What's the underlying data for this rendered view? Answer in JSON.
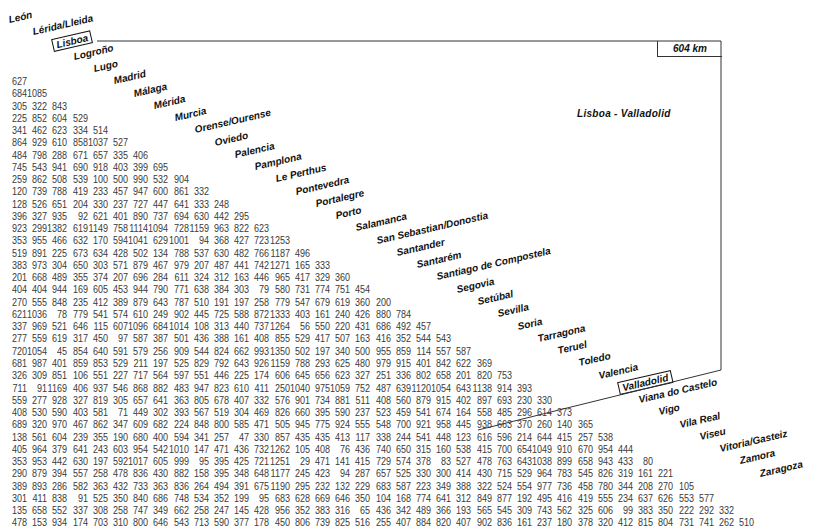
{
  "highlight": {
    "distance_label": "604 km",
    "route_label": "Lisboa - Valladolid",
    "from": "Lisboa",
    "to": "Valladolid"
  },
  "cities": [
    "León",
    "Lérida/Lleida",
    "Lisboa",
    "Logroño",
    "Lugo",
    "Madrid",
    "Málaga",
    "Mérida",
    "Murcia",
    "Orense/Ourense",
    "Oviedo",
    "Palencia",
    "Pamplona",
    "Le Perthus",
    "Pontevedra",
    "Portalegre",
    "Porto",
    "Salamanca",
    "San Sebastian/Donostia",
    "Santander",
    "Santarém",
    "Santiago de Compostela",
    "Segovia",
    "Setúbal",
    "Sevilla",
    "Soria",
    "Tarragona",
    "Teruel",
    "Toledo",
    "Valencia",
    "Valladolid",
    "Viana do Castelo",
    "Vigo",
    "Vila Real",
    "Viseu",
    "Vitoria/Gasteiz",
    "Zamora",
    "Zaragoza"
  ],
  "rows": [
    [
      "627"
    ],
    [
      "684",
      "1085"
    ],
    [
      "305",
      "322",
      "843"
    ],
    [
      "225",
      "852",
      "604",
      "529"
    ],
    [
      "341",
      "462",
      "623",
      "334",
      "514"
    ],
    [
      "864",
      "929",
      "610",
      "858",
      "1037",
      "527"
    ],
    [
      "484",
      "798",
      "288",
      "671",
      "657",
      "335",
      "406"
    ],
    [
      "745",
      "543",
      "941",
      "690",
      "918",
      "403",
      "399",
      "695"
    ],
    [
      "259",
      "862",
      "508",
      "539",
      "100",
      "500",
      "990",
      "532",
      "904"
    ],
    [
      "120",
      "739",
      "788",
      "419",
      "233",
      "457",
      "947",
      "600",
      "861",
      "332"
    ],
    [
      "128",
      "526",
      "651",
      "204",
      "330",
      "237",
      "727",
      "447",
      "641",
      "333",
      "248"
    ],
    [
      "396",
      "327",
      "935",
      "92",
      "621",
      "401",
      "890",
      "737",
      "694",
      "630",
      "442",
      "295"
    ],
    [
      "923",
      "299",
      "1382",
      "619",
      "1149",
      "758",
      "1114",
      "1094",
      "728",
      "1159",
      "963",
      "822",
      "623"
    ],
    [
      "353",
      "955",
      "466",
      "632",
      "170",
      "594",
      "1041",
      "629",
      "1001",
      "94",
      "368",
      "427",
      "723",
      "1253"
    ],
    [
      "519",
      "891",
      "225",
      "673",
      "634",
      "428",
      "502",
      "134",
      "788",
      "537",
      "630",
      "482",
      "766",
      "1187",
      "496"
    ],
    [
      "383",
      "973",
      "304",
      "650",
      "303",
      "571",
      "879",
      "467",
      "979",
      "207",
      "487",
      "441",
      "742",
      "1271",
      "165",
      "333"
    ],
    [
      "201",
      "668",
      "489",
      "355",
      "374",
      "207",
      "696",
      "284",
      "611",
      "324",
      "312",
      "163",
      "446",
      "965",
      "417",
      "329",
      "360"
    ],
    [
      "404",
      "404",
      "944",
      "169",
      "605",
      "453",
      "944",
      "790",
      "771",
      "638",
      "384",
      "303",
      "79",
      "580",
      "731",
      "774",
      "751",
      "454"
    ],
    [
      "270",
      "555",
      "848",
      "235",
      "412",
      "389",
      "879",
      "643",
      "787",
      "510",
      "191",
      "197",
      "258",
      "779",
      "547",
      "679",
      "619",
      "360",
      "200"
    ],
    [
      "621",
      "1036",
      "78",
      "779",
      "541",
      "574",
      "610",
      "249",
      "902",
      "445",
      "725",
      "588",
      "872",
      "1333",
      "403",
      "161",
      "240",
      "426",
      "880",
      "784"
    ],
    [
      "337",
      "969",
      "521",
      "646",
      "115",
      "607",
      "1096",
      "684",
      "1014",
      "108",
      "313",
      "440",
      "737",
      "1264",
      "56",
      "550",
      "220",
      "431",
      "686",
      "492",
      "457"
    ],
    [
      "277",
      "559",
      "619",
      "317",
      "450",
      "97",
      "587",
      "387",
      "501",
      "436",
      "388",
      "161",
      "408",
      "855",
      "529",
      "417",
      "507",
      "163",
      "416",
      "352",
      "544",
      "543"
    ],
    [
      "720",
      "1054",
      "45",
      "854",
      "640",
      "591",
      "579",
      "256",
      "909",
      "544",
      "824",
      "662",
      "993",
      "1350",
      "502",
      "197",
      "340",
      "500",
      "955",
      "859",
      "114",
      "557",
      "587"
    ],
    [
      "681",
      "987",
      "401",
      "859",
      "853",
      "529",
      "211",
      "197",
      "525",
      "829",
      "792",
      "643",
      "926",
      "1159",
      "788",
      "293",
      "625",
      "480",
      "979",
      "915",
      "401",
      "842",
      "622",
      "369"
    ],
    [
      "326",
      "309",
      "851",
      "106",
      "551",
      "227",
      "717",
      "564",
      "597",
      "551",
      "446",
      "225",
      "174",
      "606",
      "645",
      "656",
      "623",
      "327",
      "251",
      "336",
      "802",
      "658",
      "201",
      "820",
      "753"
    ],
    [
      "711",
      "91",
      "1169",
      "406",
      "937",
      "546",
      "868",
      "882",
      "483",
      "947",
      "823",
      "610",
      "411",
      "250",
      "1040",
      "975",
      "1059",
      "752",
      "487",
      "639",
      "1120",
      "1054",
      "643",
      "1138",
      "914",
      "393"
    ],
    [
      "559",
      "277",
      "928",
      "327",
      "819",
      "305",
      "657",
      "641",
      "363",
      "805",
      "678",
      "407",
      "332",
      "576",
      "901",
      "734",
      "881",
      "511",
      "408",
      "560",
      "879",
      "915",
      "402",
      "897",
      "693",
      "230",
      "330"
    ],
    [
      "408",
      "530",
      "590",
      "403",
      "581",
      "71",
      "449",
      "302",
      "393",
      "567",
      "519",
      "304",
      "469",
      "826",
      "660",
      "395",
      "590",
      "237",
      "523",
      "459",
      "541",
      "674",
      "164",
      "558",
      "485",
      "296",
      "614",
      "373"
    ],
    [
      "689",
      "320",
      "970",
      "467",
      "862",
      "347",
      "609",
      "682",
      "224",
      "848",
      "800",
      "585",
      "471",
      "505",
      "945",
      "775",
      "924",
      "555",
      "548",
      "700",
      "921",
      "958",
      "445",
      "938",
      "663",
      "370",
      "260",
      "140",
      "365"
    ],
    [
      "138",
      "561",
      "604",
      "239",
      "355",
      "190",
      "680",
      "400",
      "594",
      "341",
      "257",
      "47",
      "330",
      "857",
      "435",
      "435",
      "413",
      "117",
      "338",
      "244",
      "541",
      "448",
      "123",
      "616",
      "596",
      "214",
      "644",
      "415",
      "257",
      "538"
    ],
    [
      "405",
      "964",
      "379",
      "641",
      "243",
      "603",
      "954",
      "542",
      "1010",
      "147",
      "471",
      "436",
      "732",
      "1262",
      "105",
      "408",
      "76",
      "436",
      "740",
      "650",
      "315",
      "160",
      "538",
      "415",
      "700",
      "654",
      "1049",
      "910",
      "670",
      "954",
      "444"
    ],
    [
      "353",
      "953",
      "442",
      "630",
      "197",
      "592",
      "1017",
      "605",
      "999",
      "95",
      "395",
      "425",
      "721",
      "1251",
      "29",
      "471",
      "141",
      "415",
      "729",
      "574",
      "378",
      "83",
      "527",
      "478",
      "763",
      "643",
      "1038",
      "899",
      "658",
      "943",
      "433",
      "80"
    ],
    [
      "290",
      "879",
      "394",
      "557",
      "258",
      "478",
      "836",
      "430",
      "882",
      "158",
      "395",
      "348",
      "648",
      "1177",
      "245",
      "423",
      "94",
      "287",
      "657",
      "525",
      "330",
      "300",
      "414",
      "430",
      "715",
      "529",
      "964",
      "783",
      "545",
      "826",
      "319",
      "161",
      "221"
    ],
    [
      "389",
      "893",
      "286",
      "582",
      "363",
      "432",
      "733",
      "363",
      "836",
      "264",
      "494",
      "391",
      "675",
      "1190",
      "295",
      "232",
      "132",
      "229",
      "683",
      "587",
      "223",
      "349",
      "388",
      "322",
      "524",
      "554",
      "977",
      "736",
      "458",
      "780",
      "344",
      "208",
      "270",
      "105"
    ],
    [
      "301",
      "411",
      "838",
      "91",
      "525",
      "350",
      "840",
      "686",
      "748",
      "534",
      "352",
      "199",
      "95",
      "683",
      "628",
      "669",
      "646",
      "350",
      "104",
      "168",
      "774",
      "641",
      "312",
      "849",
      "877",
      "192",
      "495",
      "416",
      "419",
      "555",
      "234",
      "637",
      "626",
      "553",
      "577"
    ],
    [
      "135",
      "658",
      "552",
      "337",
      "308",
      "258",
      "747",
      "349",
      "662",
      "258",
      "247",
      "145",
      "428",
      "956",
      "352",
      "383",
      "316",
      "65",
      "436",
      "342",
      "489",
      "366",
      "193",
      "565",
      "545",
      "309",
      "743",
      "562",
      "325",
      "606",
      "99",
      "383",
      "350",
      "222",
      "292",
      "332"
    ],
    [
      "478",
      "153",
      "934",
      "174",
      "703",
      "310",
      "800",
      "646",
      "543",
      "713",
      "590",
      "377",
      "178",
      "450",
      "806",
      "739",
      "825",
      "516",
      "255",
      "407",
      "884",
      "820",
      "407",
      "902",
      "836",
      "161",
      "237",
      "180",
      "378",
      "320",
      "412",
      "815",
      "804",
      "731",
      "741",
      "262",
      "510"
    ]
  ]
}
